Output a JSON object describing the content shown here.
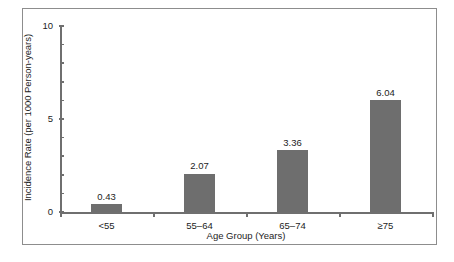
{
  "chart_data": {
    "type": "bar",
    "title": "",
    "xlabel": "Age Group (Years)",
    "ylabel": "Incidence Rate (per 1000 Person-years)",
    "categories": [
      "<55",
      "55–64",
      "65–74",
      "≥75"
    ],
    "values": [
      0.43,
      2.07,
      3.36,
      6.04
    ],
    "value_labels": [
      "0.43",
      "2.07",
      "3.36",
      "6.04"
    ],
    "ylim": [
      0,
      10
    ],
    "xlim": [
      0,
      4
    ],
    "y_major_ticks": [
      0,
      5,
      10
    ],
    "y_major_tick_labels": [
      "0",
      "5",
      "10"
    ],
    "y_minor_ticks": [
      1,
      2,
      3,
      4,
      6,
      7,
      8,
      9
    ],
    "grid": false,
    "legend": null,
    "bar_color": "#6e6e6e",
    "axis_color": "#6f6f6f",
    "text_color": "#1d1d1d",
    "frame_color": "#8d8d8d",
    "background": "#ffffff"
  }
}
